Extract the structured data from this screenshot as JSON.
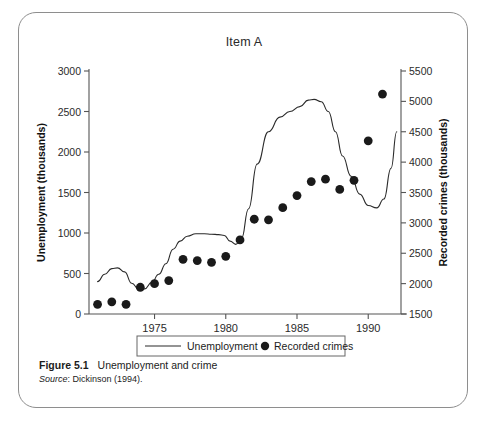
{
  "figure": {
    "caption_label": "Figure 5.1",
    "caption_text": "Unemployment and crime",
    "source_label": "Source",
    "source_text": ": Dickinson (1994)."
  },
  "chart_data": {
    "type": "line",
    "title": "Item A",
    "xlabel": "",
    "xlim": [
      1970.4,
      1992.3
    ],
    "xticks": [
      1975,
      1980,
      1985,
      1990
    ],
    "xtick_labels": [
      "1975",
      "1980",
      "1985",
      "1990"
    ],
    "grid": false,
    "legend_position": "below-axes",
    "legend_entries": [
      {
        "label": "Unemployment",
        "marker": "line",
        "color": "#222222"
      },
      {
        "label": "Recorded crimes",
        "marker": "circle",
        "color": "#1a1a1a"
      }
    ],
    "axes": [
      {
        "side": "left",
        "ylabel": "Unemployment (thousands)",
        "ylim": [
          0,
          3000
        ],
        "yticks": [
          0,
          500,
          1000,
          1500,
          2000,
          2500,
          3000
        ],
        "ytick_labels": [
          "0",
          "500",
          "1000",
          "1500",
          "2000",
          "2500",
          "3000"
        ]
      },
      {
        "side": "right",
        "ylabel": "Recorded crimes (thousands)",
        "ylim": [
          1500,
          5500
        ],
        "yticks": [
          1500,
          2000,
          2500,
          3000,
          3500,
          4000,
          4500,
          5000,
          5500
        ],
        "ytick_labels": [
          "1500",
          "2000",
          "2500",
          "3000",
          "3500",
          "4000",
          "4500",
          "5000",
          "5500"
        ]
      }
    ],
    "series": [
      {
        "name": "Unemployment",
        "axis": "left",
        "type": "line",
        "x": [
          1971.0,
          1971.5,
          1972.0,
          1972.4,
          1972.9,
          1973.4,
          1973.9,
          1974.3,
          1974.8,
          1975.3,
          1975.8,
          1976.3,
          1976.8,
          1977.3,
          1977.9,
          1978.5,
          1979.0,
          1979.5,
          1979.9,
          1980.3,
          1980.7,
          1981.1,
          1981.6,
          1982.2,
          1983.0,
          1983.8,
          1984.5,
          1985.2,
          1985.8,
          1986.2,
          1986.7,
          1987.2,
          1987.7,
          1988.2,
          1988.8,
          1989.4,
          1990.0,
          1990.6,
          1991.1,
          1991.6,
          1992.0
        ],
        "y": [
          400,
          490,
          560,
          570,
          520,
          380,
          305,
          310,
          390,
          490,
          620,
          800,
          900,
          960,
          990,
          990,
          985,
          980,
          970,
          900,
          860,
          930,
          1300,
          1850,
          2250,
          2430,
          2500,
          2560,
          2640,
          2650,
          2620,
          2500,
          2250,
          1950,
          1700,
          1480,
          1340,
          1310,
          1420,
          1800,
          2250
        ]
      },
      {
        "name": "Recorded crimes",
        "axis": "right",
        "type": "scatter",
        "x": [
          1971,
          1972,
          1973,
          1974,
          1975,
          1976,
          1977,
          1978,
          1979,
          1980,
          1981,
          1982,
          1983,
          1984,
          1985,
          1986,
          1987,
          1988,
          1989,
          1990,
          1991
        ],
        "y": [
          1660,
          1700,
          1660,
          1940,
          2000,
          2050,
          2400,
          2380,
          2350,
          2450,
          2720,
          3060,
          3050,
          3250,
          3450,
          3680,
          3720,
          3550,
          3700,
          4350,
          5120
        ]
      }
    ]
  }
}
